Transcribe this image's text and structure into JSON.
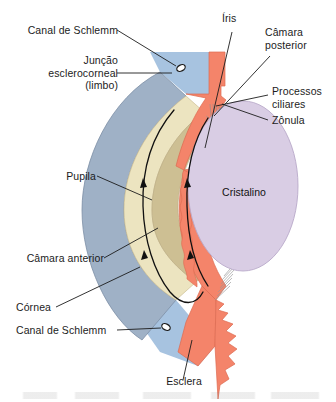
{
  "figure": {
    "language": "pt-BR",
    "background": "#ffffff"
  },
  "labels": {
    "canal_schlemm_top": "Canal de Schlemm",
    "juncao_esclerocorneal": "Junção\nesclerocorneal\n(limbo)",
    "pupila": "Pupila",
    "camara_anterior": "Câmara anterior",
    "cornea": "Córnea",
    "canal_schlemm_bottom": "Canal de Schlemm",
    "esclera": "Esclera",
    "iris": "Íris",
    "camara_posterior": "Câmara\nposterior",
    "processos_ciliares": "Processos\nciliares",
    "zonula": "Zônula",
    "cristalino": "Cristalino"
  },
  "structures": [
    {
      "name": "esclera",
      "label": "Esclera",
      "color": "#a9c4de"
    },
    {
      "name": "cornea",
      "label": "Córnea",
      "color": "#9fb1c6"
    },
    {
      "name": "camara-anterior",
      "label": "Câmara anterior",
      "color": "#ece4c0"
    },
    {
      "name": "iris",
      "label": "Íris",
      "color": "#f4846a"
    },
    {
      "name": "corpo-ciliar",
      "label": "Processos ciliares",
      "color": "#f4846a"
    },
    {
      "name": "cristalino",
      "label": "Cristalino",
      "color": "#d9cde4"
    },
    {
      "name": "camara-posterior",
      "label": "Câmara posterior",
      "color": "#cdbf93"
    },
    {
      "name": "zonula",
      "label": "Zônula",
      "color": "#8d8d8d"
    },
    {
      "name": "canal-de-schlemm",
      "label": "Canal de Schlemm",
      "color": "#2b2b2b"
    }
  ],
  "colors": {
    "sclera_blue": "#a9c4de",
    "cornea_grey_blue": "#9fb1c6",
    "anterior_chamber_cream": "#ece4c0",
    "iris_salmon": "#f4846a",
    "lens_lavender": "#d9cde4",
    "posterior_chamber_tan": "#cdbf93",
    "zonule_grey": "#8d8d8d",
    "leader_line": "#1c1c1c",
    "text": "#1c1c1c"
  },
  "annotations": {
    "flow_arrows": "Setas indicam o fluxo do humor aquoso ao redor da pupila"
  }
}
